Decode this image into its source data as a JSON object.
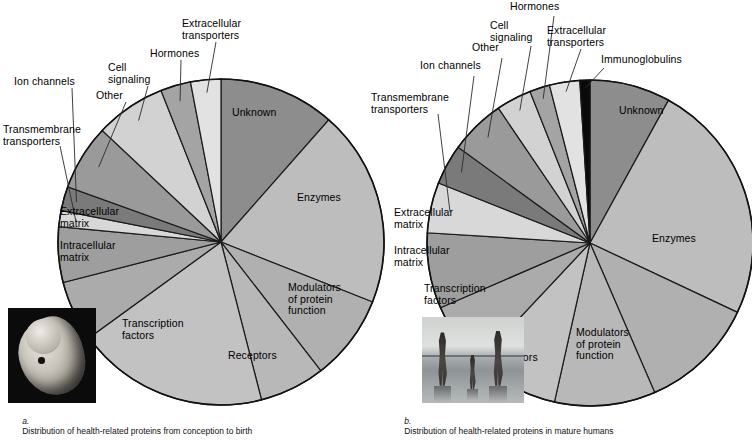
{
  "figure": {
    "title": "",
    "panels": [
      {
        "id": "a",
        "caption_letter": "a.",
        "caption_text": "Distribution of health-related proteins from conception to birth",
        "photo_name": "human-embryo-photo",
        "photo_alt": "Human embryo"
      },
      {
        "id": "b",
        "caption_letter": "b.",
        "caption_text": "Distribution of health-related proteins in mature humans",
        "photo_name": "family-on-beach-photo",
        "photo_alt": "Family walking on a beach"
      }
    ]
  },
  "chart_data": [
    {
      "type": "pie",
      "title": "Distribution of health-related proteins from conception to birth",
      "panel": "a",
      "start_angle_deg": 0,
      "direction": "clockwise",
      "legend": "inline-labels",
      "categories": [
        "Unknown",
        "Enzymes",
        "Modulators of protein function",
        "Receptors",
        "Transcription factors",
        "Intracellular matrix",
        "Extracellular matrix",
        "Transmembrane transporters",
        "Ion channels",
        "Other",
        "Cell signaling",
        "Hormones",
        "Extracellular transporters"
      ],
      "values": [
        11.5,
        19.5,
        8.5,
        6.5,
        19.0,
        6.0,
        5.5,
        1.6,
        2.4,
        6.5,
        7.0,
        3.0,
        3.0
      ],
      "colors": [
        "#8d8d8d",
        "#bdbdbd",
        "#b0b0b0",
        "#b8b8b8",
        "#c2c2c2",
        "#ababab",
        "#9e9e9e",
        "#d8d8d8",
        "#7a7a7a",
        "#9a9a9a",
        "#d2d2d2",
        "#a4a4a4",
        "#e2e2e2"
      ],
      "inside_labels": [
        "Unknown",
        "Enzymes",
        "Modulators of protein function",
        "Receptors",
        "Transcription factors",
        "Intracellular matrix",
        "Extracellular matrix"
      ],
      "callout_labels": [
        "Transmembrane transporters",
        "Ion channels",
        "Other",
        "Cell signaling",
        "Hormones",
        "Extracellular transporters"
      ]
    },
    {
      "type": "pie",
      "title": "Distribution of health-related proteins in mature humans",
      "panel": "b",
      "start_angle_deg": 0,
      "direction": "clockwise",
      "legend": "inline-labels",
      "categories": [
        "Unknown",
        "Enzymes",
        "Modulators of protein function",
        "Receptors",
        "Transcription factors",
        "Intracellular matrix",
        "Extracellular matrix",
        "Transmembrane transporters",
        "Ion channels",
        "Other",
        "Cell signaling",
        "Hormones",
        "Extracellular transporters",
        "Immunoglobulins"
      ],
      "values": [
        8.0,
        24.0,
        11.5,
        10.0,
        8.5,
        6.5,
        7.5,
        5.0,
        4.0,
        5.5,
        3.5,
        2.0,
        3.0,
        1.0
      ],
      "colors": [
        "#8d8d8d",
        "#bdbdbd",
        "#b0b0b0",
        "#b8b8b8",
        "#c2c2c2",
        "#ababab",
        "#9e9e9e",
        "#d8d8d8",
        "#7a7a7a",
        "#9a9a9a",
        "#d2d2d2",
        "#a4a4a4",
        "#e2e2e2",
        "#0a0a0a"
      ],
      "inside_labels": [
        "Unknown",
        "Enzymes",
        "Modulators of protein function",
        "Receptors",
        "Transcription factors",
        "Intracellular matrix",
        "Extracellular matrix"
      ],
      "callout_labels": [
        "Transmembrane transporters",
        "Ion channels",
        "Other",
        "Cell signaling",
        "Hormones",
        "Extracellular transporters",
        "Immunoglobulins"
      ]
    }
  ],
  "panel_a_labels": {
    "unknown": "Unknown",
    "enzymes": "Enzymes",
    "modulators": "Modulators\nof protein\nfunction",
    "receptors": "Receptors",
    "transcription": "Transcription\nfactors",
    "intracellular": "Intracellular\nmatrix",
    "extracellular": "Extracellular\nmatrix",
    "transmembrane": "Transmembrane\ntransporters",
    "ion_channels": "Ion channels",
    "other": "Other",
    "cell_signaling": "Cell\nsignaling",
    "hormones": "Hormones",
    "extra_transporters": "Extracellular\ntransporters"
  },
  "panel_b_labels": {
    "unknown": "Unknown",
    "enzymes": "Enzymes",
    "modulators": "Modulators\nof protein\nfunction",
    "receptors": "Receptors",
    "transcription": "Transcription\nfactors",
    "intracellular": "Intracellular\nmatrix",
    "extracellular": "Extracellular\nmatrix",
    "transmembrane": "Transmembrane\ntransporters",
    "ion_channels": "Ion channels",
    "other": "Other",
    "cell_signaling": "Cell\nsignaling",
    "hormones": "Hormones",
    "extra_transporters": "Extracellular\ntransporters",
    "immunoglobulins": "Immunoglobulins"
  }
}
